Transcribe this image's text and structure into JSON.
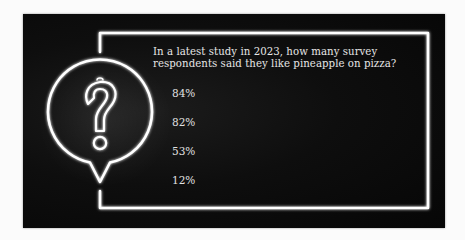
{
  "quiz": {
    "question_line1": "In a latest study in 2023, how many survey",
    "question_line2": "respondents said they like pineapple on pizza?",
    "options": [
      {
        "label": "84%"
      },
      {
        "label": "82%"
      },
      {
        "label": "53%"
      },
      {
        "label": "12%"
      }
    ]
  },
  "icons": {
    "bubble": "question-mark-speech-bubble"
  },
  "colors": {
    "background": "#0b0b0b",
    "neon": "#ffffff",
    "text": "#e6e6e6",
    "page": "#fbfbfb"
  }
}
